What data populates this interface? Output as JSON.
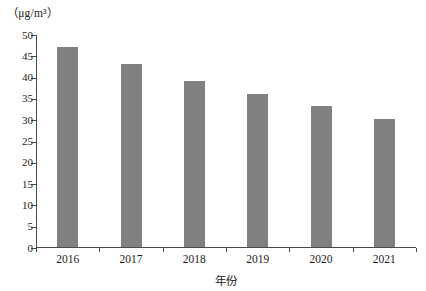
{
  "chart_data": {
    "type": "bar",
    "title": "",
    "subtitle": "",
    "unit_label": "（μg/m³）",
    "xlabel": "年份",
    "ylabel": "",
    "categories": [
      "2016",
      "2017",
      "2018",
      "2019",
      "2020",
      "2021"
    ],
    "values": [
      47,
      43,
      39,
      36,
      33,
      30
    ],
    "series": [
      {
        "name": "",
        "values": [
          47,
          43,
          39,
          36,
          33,
          30
        ]
      }
    ],
    "ylim": [
      0,
      50
    ],
    "ytick_labels": [
      "0",
      "5",
      "10",
      "15",
      "20",
      "25",
      "30",
      "35",
      "40",
      "45",
      "50"
    ],
    "ytick_values": [
      0,
      5,
      10,
      15,
      20,
      25,
      30,
      35,
      40,
      45,
      50
    ],
    "xtick_labels": [
      "2016",
      "2017",
      "2018",
      "2019",
      "2020",
      "2021"
    ],
    "grid": false,
    "legend": null,
    "legend_position": "none",
    "annotations": [],
    "bar_color": "#808080",
    "axis_color": "#4a4a4a",
    "background_color": "#ffffff",
    "text_color": "#1a1a1a"
  }
}
